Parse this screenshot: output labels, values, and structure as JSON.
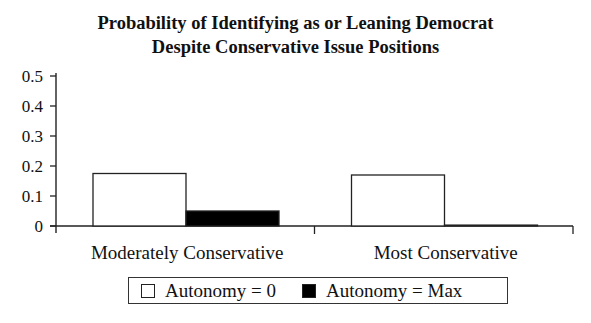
{
  "chart_data": {
    "type": "bar",
    "title_lines": [
      "Probability of Identifying as or Leaning Democrat",
      "Despite Conservative Issue Positions"
    ],
    "xlabel": "",
    "ylabel": "",
    "ylim": [
      0,
      0.5
    ],
    "yticks": [
      "0",
      "0.1",
      "0.2",
      "0.3",
      "0.4",
      "0.5"
    ],
    "categories": [
      "Moderately Conservative",
      "Most Conservative"
    ],
    "series": [
      {
        "name": "Autonomy = 0",
        "values": [
          0.175,
          0.17
        ],
        "color": "#ffffff"
      },
      {
        "name": "Autonomy = Max",
        "values": [
          0.05,
          0.003
        ],
        "color": "#000000"
      }
    ],
    "grid": false,
    "legend": "bottom"
  }
}
